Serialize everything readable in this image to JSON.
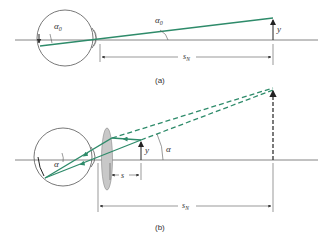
{
  "figure": {
    "part_a": {
      "caption": "(a)",
      "labels": {
        "angle_eye": "α",
        "angle_eye_sub": "0",
        "angle_ray": "α",
        "angle_ray_sub": "0",
        "height": "y",
        "distance": "s",
        "distance_sub": "N"
      }
    },
    "part_b": {
      "caption": "(b)",
      "labels": {
        "angle_eye": "α",
        "angle_ray": "α",
        "height": "y",
        "object_distance": "s",
        "distance": "s",
        "distance_sub": "N"
      }
    },
    "colors": {
      "ray": "#2e8b6a",
      "line": "#555555",
      "lens": "#c8c8c8"
    }
  }
}
